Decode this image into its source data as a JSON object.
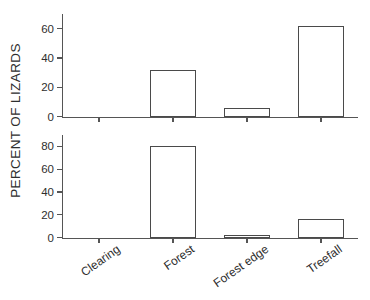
{
  "chart_data": {
    "type": "bar",
    "title": "",
    "xlabel": "",
    "ylabel": "PERCENT OF LIZARDS",
    "categories": [
      "Clearing",
      "Forest",
      "Forest edge",
      "Treefall"
    ],
    "grid": false,
    "legend": false,
    "panels": [
      {
        "name": "top-panel",
        "values": [
          0,
          32,
          6,
          62
        ],
        "yticks": [
          0,
          20,
          40,
          60
        ],
        "ytick_labels": [
          "0",
          "20",
          "40",
          "60"
        ],
        "ylim": [
          0,
          70
        ]
      },
      {
        "name": "bottom-panel",
        "values": [
          0,
          80,
          2,
          16
        ],
        "yticks": [
          0,
          20,
          40,
          60,
          80
        ],
        "ytick_labels": [
          "0",
          "20",
          "40",
          "60",
          "80"
        ],
        "ylim": [
          0,
          90
        ]
      }
    ]
  },
  "style": {
    "background": "#ffffff",
    "axis_color": "#555555",
    "bar_edge_color": "#4a4a4a",
    "bar_fill_color": "#ffffff",
    "text_color": "#2e2e2e"
  }
}
